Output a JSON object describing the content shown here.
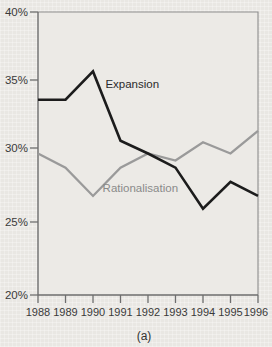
{
  "chart_data": {
    "type": "line",
    "title": "",
    "subtitle": "",
    "caption": "(a)",
    "xlabel": "",
    "ylabel": "",
    "x": [
      1988,
      1989,
      1990,
      1991,
      1992,
      1993,
      1994,
      1995,
      1996
    ],
    "categories": [
      "1988",
      "1989",
      "1990",
      "1991",
      "1992",
      "1993",
      "1994",
      "1995",
      "1996"
    ],
    "xtick_labels": [
      "1988",
      "1989",
      "1990",
      "1991",
      "1992",
      "1993",
      "1994",
      "1995",
      "1996"
    ],
    "ytick_labels": [
      "40%",
      "35%",
      "30%",
      "25%",
      "20%"
    ],
    "ytick_values": [
      40,
      35,
      30,
      25,
      20
    ],
    "ylim": [
      20,
      40
    ],
    "xlim": [
      1988,
      1996
    ],
    "grid": false,
    "legend_position": "inline-annotation",
    "series": [
      {
        "name": "Expansion",
        "color": "#1c1c1c",
        "values": [
          33.8,
          33.8,
          35.8,
          30.9,
          30.0,
          29.0,
          26.1,
          28.0,
          27.0
        ],
        "label_x": 1990.45,
        "label_y": 34.6
      },
      {
        "name": "Rationalisation",
        "color": "#9a9a9a",
        "values": [
          30.0,
          29.0,
          27.0,
          29.0,
          30.0,
          29.5,
          30.8,
          30.0,
          31.6
        ],
        "label_x": 1990.35,
        "label_y": 27.25
      }
    ]
  },
  "axis": {
    "y_tick_suffix": "%",
    "x_axis_name": "year"
  }
}
